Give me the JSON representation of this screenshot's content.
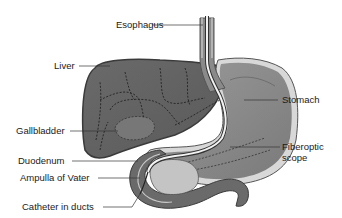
{
  "diagram": {
    "type": "anatomical-illustration",
    "labels": [
      {
        "id": "esophagus",
        "text": "Esophagus"
      },
      {
        "id": "liver",
        "text": "Liver"
      },
      {
        "id": "stomach",
        "text": "Stomach"
      },
      {
        "id": "gallbladder",
        "text": "Gallbladder"
      },
      {
        "id": "fiberoptic-scope",
        "text": "Fiberoptic scope",
        "lines": [
          "Fiberoptic",
          "scope"
        ]
      },
      {
        "id": "duodenum",
        "text": "Duodenum"
      },
      {
        "id": "ampulla",
        "text": "Ampulla of Vater"
      },
      {
        "id": "catheter",
        "text": "Catheter in ducts"
      }
    ],
    "colors": {
      "background": "#ffffff",
      "liver": "#6e6e6e",
      "liver_outline": "#3a3a3a",
      "stomach": "#8a8a8a",
      "stomach_wall": "#c8c8c8",
      "duodenum": "#6a6a6a",
      "pancreas": "#c4c4c4",
      "scope": "#f2f2f2",
      "text": "#1a1a1a"
    }
  }
}
